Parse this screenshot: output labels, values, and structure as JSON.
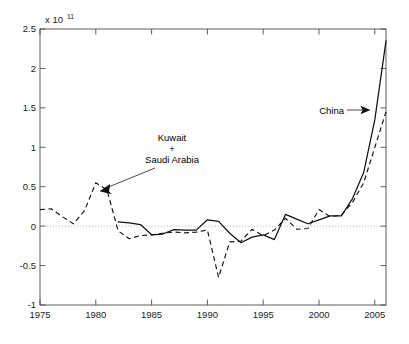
{
  "figure": {
    "background_color": "#ffffff",
    "width": 409,
    "height": 344
  },
  "chart_data": {
    "type": "line",
    "title": "",
    "subtitle": "",
    "xlabel": "",
    "ylabel": "",
    "y_exponent_base": "x 10",
    "y_exponent_power": "11",
    "y_exponent_label": "x 10^11",
    "grid": false,
    "legend_position": "none",
    "xlim": [
      1975,
      2006
    ],
    "ylim": [
      -1,
      2.5
    ],
    "x_ticks": [
      1975,
      1980,
      1985,
      1990,
      1995,
      2000,
      2005
    ],
    "x_tick_labels": [
      "1975",
      "1980",
      "1985",
      "1990",
      "1995",
      "2000",
      "2005"
    ],
    "y_ticks": [
      -1,
      -0.5,
      0,
      0.5,
      1,
      1.5,
      2,
      2.5
    ],
    "y_tick_labels": [
      "-1",
      "-0.5",
      "0",
      "0.5",
      "1",
      "1.5",
      "2",
      "2.5"
    ],
    "y_units_note": "values in units of 1e11",
    "zero_reference_line": {
      "value": 0,
      "style": "dotted",
      "color": "#a8a8a8"
    },
    "series": [
      {
        "name": "China",
        "style": "solid",
        "color": "#121212",
        "x": [
          1982,
          1983,
          1984,
          1985,
          1986,
          1987,
          1988,
          1989,
          1990,
          1991,
          1992,
          1993,
          1994,
          1995,
          1996,
          1997,
          1998,
          1999,
          2000,
          2001,
          2002,
          2003,
          2004,
          2005,
          2006
        ],
        "values": [
          0.055,
          0.04,
          0.02,
          -0.11,
          -0.1,
          -0.045,
          -0.05,
          -0.05,
          0.08,
          0.06,
          -0.09,
          -0.21,
          -0.14,
          -0.11,
          -0.17,
          0.15,
          0.09,
          0.03,
          0.08,
          0.13,
          0.13,
          0.35,
          0.68,
          1.35,
          2.35
        ]
      },
      {
        "name": "Kuwait + Saudi Arabia",
        "style": "dashed",
        "color": "#121212",
        "x": [
          1975,
          1976,
          1977,
          1978,
          1979,
          1980,
          1981,
          1982,
          1983,
          1984,
          1985,
          1986,
          1987,
          1988,
          1989,
          1990,
          1991,
          1992,
          1993,
          1994,
          1995,
          1996,
          1997,
          1998,
          1999,
          2000,
          2001,
          2002,
          2003,
          2004,
          2005,
          2006
        ],
        "values": [
          0.21,
          0.22,
          0.12,
          0.03,
          0.2,
          0.55,
          0.46,
          -0.06,
          -0.16,
          -0.12,
          -0.11,
          -0.09,
          -0.075,
          -0.085,
          -0.075,
          -0.05,
          -0.65,
          -0.2,
          -0.19,
          -0.04,
          -0.12,
          -0.05,
          0.1,
          -0.04,
          -0.03,
          0.21,
          0.12,
          0.14,
          0.3,
          0.55,
          1.0,
          1.45
        ]
      }
    ],
    "annotations": [
      {
        "name": "kuwait-saudi-annotation",
        "lines": [
          "Kuwait",
          "+",
          "Saudi Arabia"
        ],
        "text": "Kuwait + Saudi Arabia",
        "label_anchor_x": 172,
        "label_anchor_y": 145,
        "arrow_tip_x": 100,
        "arrow_tip_y": 191,
        "arrow_tail_x": 155,
        "arrow_tail_y": 168
      },
      {
        "name": "china-annotation",
        "lines": [
          "China"
        ],
        "text": "China",
        "label_anchor_x": 326,
        "label_anchor_y": 113,
        "arrow_tip_x": 369,
        "arrow_tip_y": 110,
        "arrow_tail_x": 345,
        "arrow_tail_y": 110
      }
    ]
  }
}
